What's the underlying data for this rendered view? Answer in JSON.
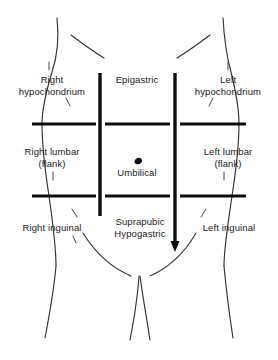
{
  "figure": {
    "background_color": "#ffffff",
    "ink_color": "#1a1a1a",
    "outline_color": "#333333"
  },
  "regions": [
    {
      "id": "right-hypochondrium",
      "label": "Right\nhypochondrium",
      "x": 6,
      "y": 74,
      "width": 92
    },
    {
      "id": "epigastric",
      "label": "Epigastric",
      "x": 104,
      "y": 74,
      "width": 66
    },
    {
      "id": "left-hypochondrium",
      "label": "Left\nhypochondrium",
      "x": 180,
      "y": 74,
      "width": 96
    },
    {
      "id": "right-lumbar-flank",
      "label": "Right  lumbar\n(flank)",
      "x": 6,
      "y": 146,
      "width": 92
    },
    {
      "id": "umbilical",
      "label": "Umbilical",
      "x": 104,
      "y": 167,
      "width": 66
    },
    {
      "id": "left-lumbar-flank",
      "label": "Left  lumbar\n(flank)",
      "x": 182,
      "y": 146,
      "width": 92
    },
    {
      "id": "right-inguinal",
      "label": "Right  inguinal",
      "x": 2,
      "y": 222,
      "width": 100
    },
    {
      "id": "suprapubic-hypogastric",
      "label": "Suprapubic\nHypogastric",
      "x": 104,
      "y": 216,
      "width": 72
    },
    {
      "id": "left-inguinal",
      "label": "Left  inguinal",
      "x": 182,
      "y": 222,
      "width": 94
    }
  ],
  "planes": {
    "vertical_left": {
      "name": "left midclavicular line",
      "x": 100,
      "y1": 73,
      "y2": 216
    },
    "vertical_right": {
      "name": "right midclavicular line",
      "x": 175,
      "y1": 73,
      "y2": 250,
      "arrowhead": true
    },
    "transverse_upper": {
      "name": "subcostal / transpyloric plane",
      "y": 124
    },
    "transverse_lower": {
      "name": "intertubercular plane",
      "y": 196
    }
  },
  "anatomy_marks": {
    "umbilicus": {
      "name": "umbilicus",
      "x": 138,
      "y": 162
    }
  }
}
